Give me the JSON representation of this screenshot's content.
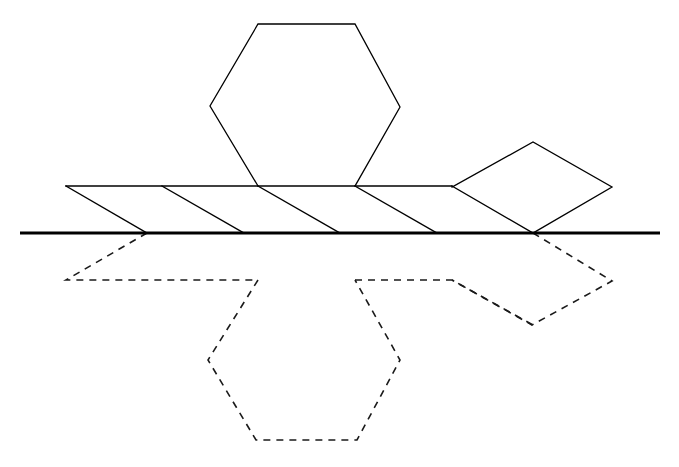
{
  "canvas": {
    "width": 679,
    "height": 467,
    "background": "#ffffff"
  },
  "style": {
    "solid_color": "#000000",
    "dashed_color": "#1a1a1a",
    "mirror_color": "#000000",
    "solid_width": 1.3,
    "dashed_width": 1.6,
    "mirror_width": 3.2,
    "dash_pattern": "7 6"
  },
  "diagram": {
    "mirror_axis_y": 233,
    "parts": {
      "mirror_line": {
        "label": "mirror-axis",
        "points": "20,233 660,233"
      },
      "upper_hexagon": {
        "label": "upper-hexagon",
        "points": "258,186 210,106 258,24 355,24 400,107 355,186"
      },
      "band_top_edge": {
        "label": "band-top-edge",
        "points": "66,186 452,186"
      },
      "band_diagonal_1": {
        "label": "band-diagonal-1",
        "points": "66,186 147,233"
      },
      "band_diagonal_2": {
        "label": "band-diagonal-2",
        "points": "162,186 244,233"
      },
      "band_diagonal_3": {
        "label": "band-diagonal-3",
        "points": "258,186 340,233"
      },
      "band_diagonal_4": {
        "label": "band-diagonal-4",
        "points": "355,186 437,233"
      },
      "band_diagonal_5": {
        "label": "band-diagonal-5",
        "points": "452,186 533,233"
      },
      "right_rhombus": {
        "label": "right-rhombus",
        "points": "452,187 533,142 612,187 533,233"
      },
      "reflected_left_tab": {
        "label": "reflected-left-tab",
        "points": "147,233 66,280 258,280"
      },
      "reflected_hexagon": {
        "label": "reflected-hexagon",
        "points": "258,280 208,360 256,440 357,440 400,360 355,280"
      },
      "reflected_right_band": {
        "label": "reflected-right-band",
        "points": "355,280 452,280 533,325"
      },
      "reflected_rhombus": {
        "label": "reflected-rhombus",
        "points": "533,233 612,281 532,325 452,280"
      }
    }
  }
}
